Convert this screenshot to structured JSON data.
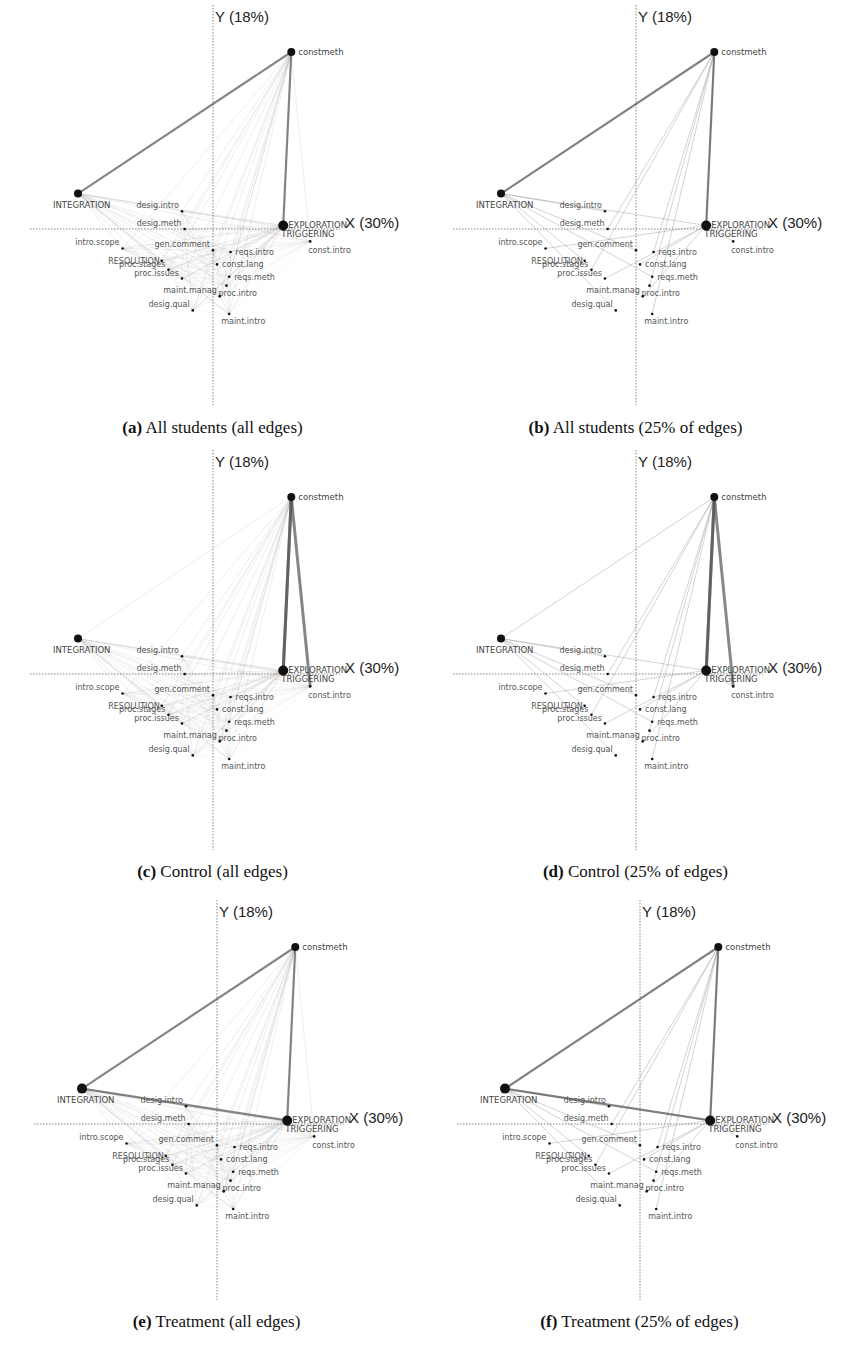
{
  "figure": {
    "panels": [
      {
        "id": "a",
        "letter": "(a)",
        "title": " All students (all edges)",
        "style": "all",
        "variant": "all"
      },
      {
        "id": "b",
        "letter": "(b)",
        "title": " All students (25% of edges)",
        "style": "all",
        "variant": "top25"
      },
      {
        "id": "c",
        "letter": "(c)",
        "title": " Control (all edges)",
        "style": "control",
        "variant": "all"
      },
      {
        "id": "d",
        "letter": "(d)",
        "title": " Control (25% of edges)",
        "style": "control",
        "variant": "top25"
      },
      {
        "id": "e",
        "letter": "(e)",
        "title": " Treatment (all edges)",
        "style": "treatment",
        "variant": "all"
      },
      {
        "id": "f",
        "letter": "(f)",
        "title": " Treatment (25% of edges)",
        "style": "treatment",
        "variant": "top25"
      }
    ]
  },
  "chart_data": {
    "type": "scatter",
    "xlabel": "X (30%)",
    "ylabel": "Y (18%)",
    "grid": false,
    "axes": "dotted crosshair at origin",
    "colors": {
      "edge": "#9a9a9a",
      "edge_strong": "#555555",
      "node": "#111111",
      "axis": "#666666"
    },
    "nodes": [
      {
        "name": "constmeth",
        "x": 0.58,
        "y": 1.0,
        "size": "large"
      },
      {
        "name": "INTEGRATION",
        "x": -1.0,
        "y": 0.2,
        "size": "large"
      },
      {
        "name": "EXPLORATION",
        "x": 0.52,
        "y": 0.02,
        "size": "large"
      },
      {
        "name": "TRIGGERING",
        "x": 0.52,
        "y": 0.01,
        "size": "large"
      },
      {
        "name": "const.intro",
        "x": 0.72,
        "y": -0.07,
        "size": "small"
      },
      {
        "name": "desig.intro",
        "x": -0.23,
        "y": 0.1,
        "size": "small"
      },
      {
        "name": "desig.meth",
        "x": -0.21,
        "y": 0.0,
        "size": "small"
      },
      {
        "name": "intro.scope",
        "x": -0.67,
        "y": -0.11,
        "size": "small"
      },
      {
        "name": "RESOLUTION",
        "x": -0.38,
        "y": -0.18,
        "size": "small"
      },
      {
        "name": "proc.stages",
        "x": -0.33,
        "y": -0.23,
        "size": "small"
      },
      {
        "name": "proc.issues",
        "x": -0.23,
        "y": -0.28,
        "size": "small"
      },
      {
        "name": "gen.comment",
        "x": 0.0,
        "y": -0.12,
        "size": "small"
      },
      {
        "name": "reqs.intro",
        "x": 0.13,
        "y": -0.13,
        "size": "small"
      },
      {
        "name": "const.lang",
        "x": 0.03,
        "y": -0.2,
        "size": "small"
      },
      {
        "name": "reqs.meth",
        "x": 0.12,
        "y": -0.27,
        "size": "small"
      },
      {
        "name": "proc.intro",
        "x": 0.1,
        "y": -0.32,
        "size": "small"
      },
      {
        "name": "maint.manag",
        "x": 0.05,
        "y": -0.38,
        "size": "small"
      },
      {
        "name": "desig.qual",
        "x": -0.15,
        "y": -0.46,
        "size": "small"
      },
      {
        "name": "maint.intro",
        "x": 0.12,
        "y": -0.48,
        "size": "small"
      }
    ],
    "groups": [
      "All students",
      "Control",
      "Treatment"
    ],
    "edge_filters": [
      "all edges",
      "25% of edges"
    ],
    "strong_edges": {
      "all": [
        "constmeth-EXPLORATION",
        "constmeth-INTEGRATION"
      ],
      "control": [
        "constmeth-EXPLORATION",
        "constmeth-TRIGGERING",
        "constmeth-const.intro"
      ],
      "treatment": [
        "constmeth-INTEGRATION",
        "constmeth-EXPLORATION",
        "INTEGRATION-EXPLORATION"
      ]
    }
  }
}
